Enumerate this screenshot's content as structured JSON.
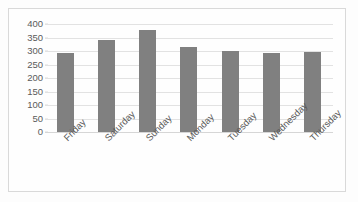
{
  "chart_data": {
    "type": "bar",
    "title": "",
    "xlabel": "",
    "ylabel": "",
    "categories": [
      "Friday",
      "Saturday",
      "Sunday",
      "Monday",
      "Tuesday",
      "Wednesday",
      "Thursday"
    ],
    "values": [
      293,
      341,
      378,
      315,
      300,
      293,
      298
    ],
    "ylim": [
      0,
      400
    ],
    "yticks": [
      400,
      350,
      300,
      250,
      200,
      150,
      100,
      50,
      0
    ],
    "ytick_labels": [
      "400",
      "350",
      "300",
      "250",
      "200",
      "150",
      "100",
      "50",
      "0"
    ],
    "grid": true,
    "legend": false,
    "legend_position": "none",
    "series": [
      {
        "name": "Series 1",
        "values": [
          293,
          341,
          378,
          315,
          300,
          293,
          298
        ]
      }
    ],
    "colors": {
      "bar": "#808080",
      "gridline": "#e2e2e2",
      "axis_text": "#5a5a5a",
      "frame_border": "#d9d9d9",
      "background": "#fefefe"
    }
  }
}
